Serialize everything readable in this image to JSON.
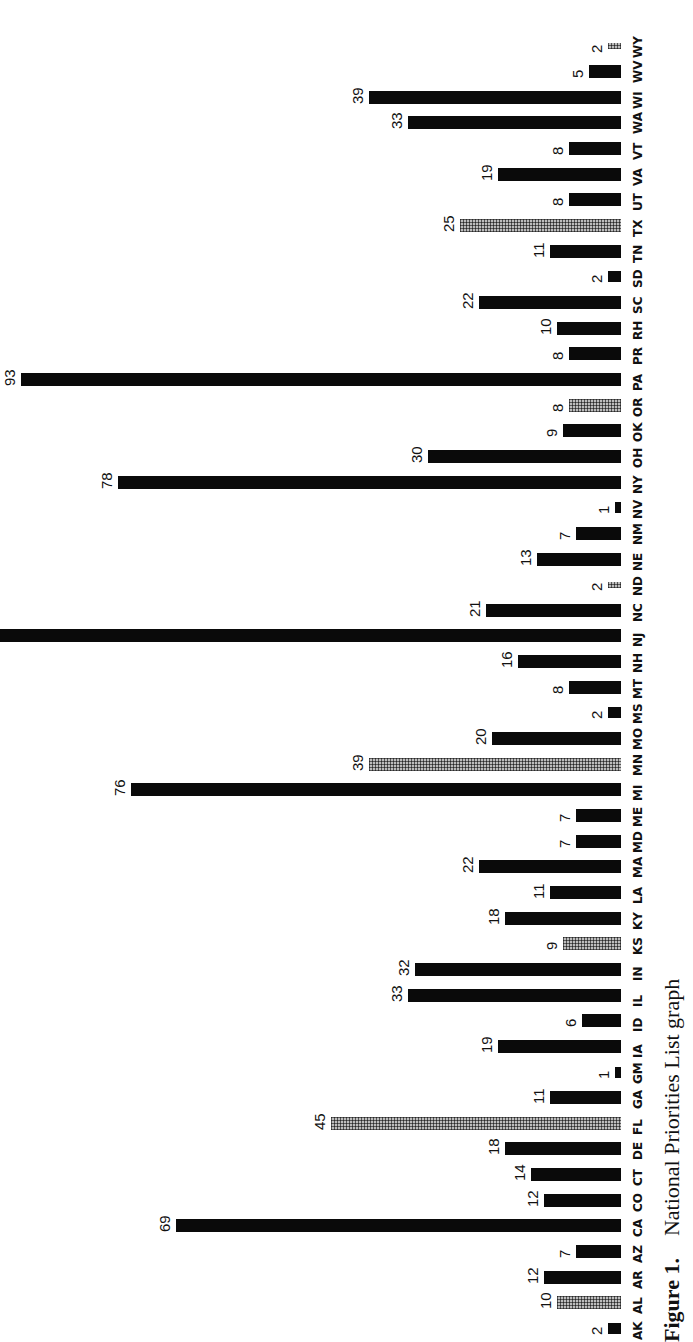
{
  "caption": {
    "figure_label": "Figure 1.",
    "title": "National Priorities List graph"
  },
  "chart_data": {
    "type": "bar",
    "orientation": "rotated 90° (bars horizontal on page, labels read bottom-to-top)",
    "title": "National Priorities List graph",
    "xlabel": "",
    "ylabel": "",
    "grid": false,
    "legend": "none (solid black bars and stippled/hatched bars used)",
    "categories": [
      "AK",
      "AL",
      "AR",
      "AZ",
      "CA",
      "CO",
      "CT",
      "DE",
      "FL",
      "GA",
      "GM",
      "IA",
      "ID",
      "IL",
      "IN",
      "KS",
      "KY",
      "LA",
      "MA",
      "MD",
      "ME",
      "MI",
      "MN",
      "MO",
      "MS",
      "MT",
      "NH",
      "NJ",
      "NC",
      "ND",
      "NE",
      "NM",
      "NV",
      "NY",
      "OH",
      "OK",
      "OR",
      "PA",
      "PR",
      "RH",
      "SC",
      "SD",
      "TN",
      "TX",
      "UT",
      "VA",
      "VT",
      "WA",
      "WI",
      "WV",
      "WY"
    ],
    "values": [
      2,
      10,
      12,
      7,
      69,
      12,
      14,
      18,
      45,
      11,
      1,
      19,
      6,
      33,
      32,
      9,
      18,
      11,
      22,
      7,
      7,
      76,
      39,
      20,
      2,
      8,
      16,
      null,
      21,
      2,
      13,
      7,
      1,
      78,
      30,
      9,
      8,
      93,
      8,
      10,
      22,
      2,
      11,
      25,
      8,
      19,
      8,
      33,
      39,
      5,
      2
    ],
    "value_labels": [
      "2",
      "10",
      "12",
      "7",
      "69",
      "12",
      "14",
      "18",
      "45",
      "11",
      "1",
      "19",
      "6",
      "33",
      "32",
      "9",
      "18",
      "11",
      "22",
      "7",
      "7",
      "76",
      "39",
      "20",
      "2",
      "8",
      "16",
      "",
      "21",
      "2",
      "13",
      "7",
      "1",
      "78",
      "30",
      "9",
      "8",
      "93",
      "8",
      "10",
      "22",
      "2",
      "11",
      "25",
      "8",
      "19",
      "8",
      "33",
      "39",
      "5",
      "2"
    ],
    "hatched": [
      "AL",
      "FL",
      "KS",
      "MN",
      "ND",
      "OR",
      "TX",
      "WY"
    ]
  },
  "layout": {
    "baseline_x": 621,
    "first_row_y": 1322,
    "row_spacing": 25.65,
    "px_per_unit": 6.45,
    "nj_length": 625
  }
}
